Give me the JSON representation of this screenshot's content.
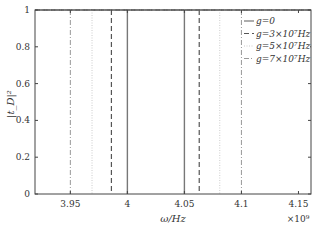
{
  "chart_data": {
    "type": "line",
    "title": "",
    "xlabel": "ω/Hz",
    "ylabel": "|t_D|²",
    "x_multiplier": "×10⁹",
    "xlim": [
      3.919,
      4.161
    ],
    "ylim": [
      0,
      1
    ],
    "xticks": [
      3.95,
      4.0,
      4.05,
      4.1,
      4.15
    ],
    "xtick_labels": [
      "3.95",
      "4",
      "4.05",
      "4.1",
      "4.15"
    ],
    "yticks": [
      0,
      0.2,
      0.4,
      0.6,
      0.8,
      1
    ],
    "ytick_labels": [
      "0",
      "0.2",
      "0.4",
      "0.6",
      "0.8",
      "1"
    ],
    "grid": false,
    "legend_position": "upper right",
    "series": [
      {
        "name": "g=0",
        "style": "solid",
        "color": "#777777",
        "dips_at": [
          4.0,
          4.05
        ],
        "baseline": 1
      },
      {
        "name": "g=3×10⁷Hz",
        "style": "dashed",
        "color": "#555555",
        "dips_at": [
          3.986,
          4.063
        ],
        "baseline": 1
      },
      {
        "name": "g=5×10⁷Hz",
        "style": "dotted",
        "color": "#cccccc",
        "dips_at": [
          3.969,
          4.081
        ],
        "baseline": 1
      },
      {
        "name": "g=7×10⁷Hz",
        "style": "dashdot",
        "color": "#999999",
        "dips_at": [
          3.95,
          4.1
        ],
        "baseline": 1
      }
    ]
  },
  "labels": {
    "xlabel": "ω/Hz",
    "ylabel": "|t_D|²",
    "multiplier": "×10⁹",
    "legend": [
      "g=0",
      "g=3×10⁷Hz",
      "g=5×10⁷Hz",
      "g=7×10⁷Hz"
    ]
  }
}
